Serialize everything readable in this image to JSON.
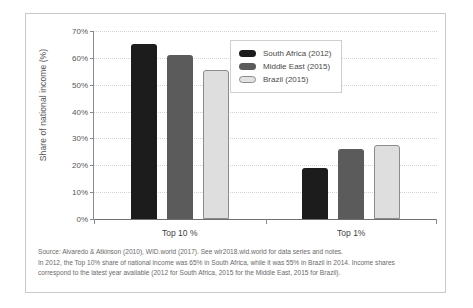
{
  "chart_data": {
    "type": "bar",
    "title": "",
    "xlabel": "",
    "ylabel": "Share of national income (%)",
    "categories": [
      "Top 10 %",
      "Top 1%"
    ],
    "series": [
      {
        "name": "South Africa (2012)",
        "color": "#1c1c1c",
        "values": [
          65,
          19
        ]
      },
      {
        "name": "Middle East (2015)",
        "color": "#5b5b5b",
        "values": [
          61,
          26
        ]
      },
      {
        "name": "Brazil (2015)",
        "color": "#dedede",
        "values": [
          55.5,
          27.5
        ]
      }
    ],
    "ylim": [
      0,
      70
    ],
    "yticks": [
      "0%",
      "10%",
      "20%",
      "30%",
      "40%",
      "50%",
      "60%",
      "70%"
    ],
    "ytick_values": [
      0,
      10,
      20,
      30,
      40,
      50,
      60,
      70
    ],
    "grid": true,
    "legend_position": "top-right"
  },
  "legend": {
    "items": [
      {
        "label": "South Africa (2012)"
      },
      {
        "label": "Middle East (2015)"
      },
      {
        "label": "Brazil (2015)"
      }
    ]
  },
  "caption": {
    "line1": "Source: Alvaredo & Atkinson (2010), WID.world (2017). See wir2018.wid.world for data series and notes.",
    "line2": "In 2012, the Top 10% share of national income was 65% in South Africa, while it was 55% in Brazil in 2014. Income shares",
    "line3": "correspond to the latest year available (2012 for South Africa, 2015 for the Middle East, 2015 for Brazil)."
  }
}
